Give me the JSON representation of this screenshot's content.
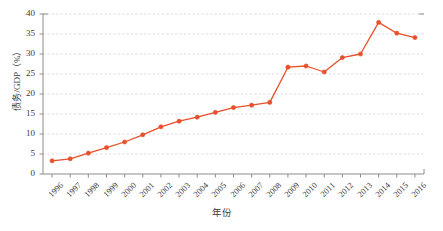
{
  "chart_data": {
    "type": "line",
    "title": "",
    "xlabel": "年份",
    "ylabel": "债务/GDP（%）",
    "ylim": [
      0,
      40
    ],
    "ytick_values": [
      0,
      5,
      10,
      15,
      20,
      25,
      30,
      35,
      40
    ],
    "ytick_labels": [
      "0",
      "5",
      "10",
      "15",
      "20",
      "25",
      "30",
      "35",
      "40"
    ],
    "grid": true,
    "grid_axis": "y",
    "legend": null,
    "legend_position": "none",
    "line_color": "#E8502A",
    "marker_color": "#E8502A",
    "marker": "circle",
    "categories": [
      "1996",
      "1997",
      "1998",
      "1999",
      "2000",
      "2001",
      "2002",
      "2003",
      "2004",
      "2005",
      "2006",
      "2007",
      "2008",
      "2009",
      "2010",
      "2011",
      "2012",
      "2013",
      "2014",
      "2015",
      "2016"
    ],
    "values": [
      3.3,
      3.8,
      5.2,
      6.6,
      8.0,
      9.8,
      11.8,
      13.2,
      14.2,
      15.4,
      16.6,
      17.2,
      17.9,
      26.7,
      27.0,
      25.5,
      29.1,
      30.0,
      37.9,
      35.2,
      34.1
    ]
  },
  "figure": {
    "caption": ""
  },
  "colors": {
    "series": "#E8502A",
    "grid": "#c9c9e0",
    "axis": "#8c8c8c",
    "text": "#3a3a3a"
  }
}
